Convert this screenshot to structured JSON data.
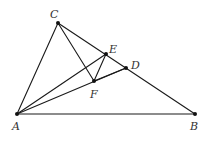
{
  "diagram": {
    "type": "geometry",
    "points": {
      "A": {
        "x": 17,
        "y": 114,
        "label": "A",
        "lx": 12,
        "ly": 130
      },
      "B": {
        "x": 195,
        "y": 114,
        "label": "B",
        "lx": 190,
        "ly": 130
      },
      "C": {
        "x": 58,
        "y": 23,
        "label": "C",
        "lx": 50,
        "ly": 18
      },
      "D": {
        "x": 126,
        "y": 68,
        "label": "D",
        "lx": 131,
        "ly": 69
      },
      "E": {
        "x": 106,
        "y": 54,
        "label": "E",
        "lx": 109,
        "ly": 53
      },
      "F": {
        "x": 94,
        "y": 81,
        "label": "F",
        "lx": 90,
        "ly": 98
      }
    },
    "segments": [
      [
        "A",
        "B"
      ],
      [
        "A",
        "C"
      ],
      [
        "C",
        "B"
      ],
      [
        "C",
        "F"
      ],
      [
        "A",
        "E"
      ],
      [
        "A",
        "D"
      ],
      [
        "E",
        "F"
      ],
      [
        "F",
        "D"
      ]
    ],
    "colors": {
      "stroke": "#1a1a1a",
      "point": "#111111",
      "label": "#333333"
    }
  }
}
